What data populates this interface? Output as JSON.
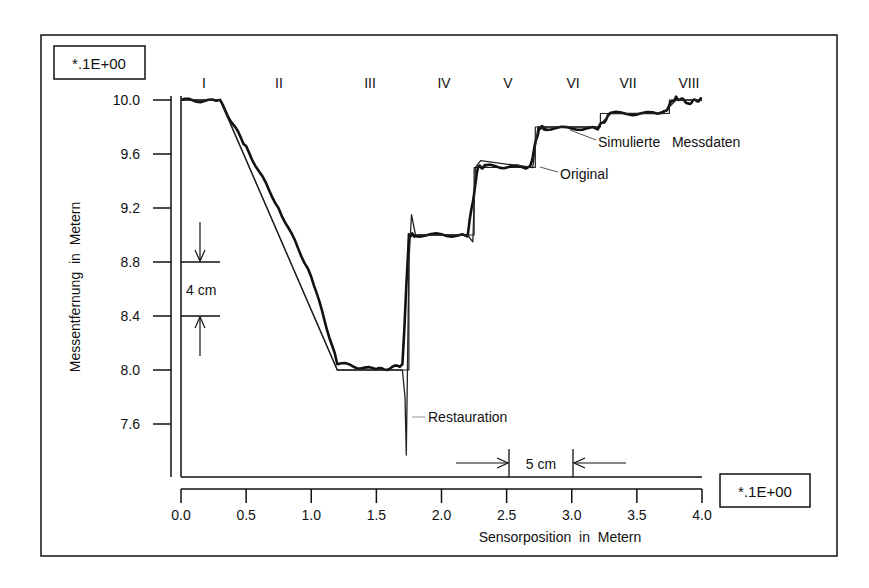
{
  "chart_data": {
    "type": "line",
    "title": "",
    "xlabel": "Sensorposition  in  Metern",
    "ylabel": "Messentfernung  in  Metern",
    "x_scale_label": "*.1E+00",
    "y_scale_label": "*.1E+00",
    "xlim": [
      0.0,
      4.0
    ],
    "ylim": [
      7.2,
      10.2
    ],
    "x_ticks": [
      "0.0",
      "0.5",
      "1.0",
      "1.5",
      "2.0",
      "2.5",
      "3.0",
      "3.5",
      "4.0"
    ],
    "y_ticks": [
      "10.0",
      "9.6",
      "9.2",
      "8.8",
      "8.4",
      "8.0",
      "7.6"
    ],
    "grid": false,
    "segments": [
      "I",
      "II",
      "III",
      "IV",
      "V",
      "VI",
      "VII",
      "VIII"
    ],
    "annotations": [
      {
        "text": "Simulierte   Messdaten",
        "points_to": "noisy measured curve"
      },
      {
        "text": "Original",
        "points_to": "ideal step profile"
      },
      {
        "text": "Restauration",
        "points_to": "restored curve (overshoot at x≈1.75)"
      },
      {
        "text": "4 cm",
        "type": "vertical dimension",
        "between_y": [
          8.4,
          8.8
        ]
      },
      {
        "text": "5 cm",
        "type": "horizontal dimension",
        "between_x": [
          2.5,
          3.0
        ]
      }
    ],
    "series": [
      {
        "name": "Original",
        "x": [
          0.0,
          0.3,
          1.2,
          1.75,
          1.75,
          2.25,
          2.25,
          2.72,
          2.72,
          3.22,
          3.22,
          3.75,
          3.75,
          4.0
        ],
        "y": [
          10.0,
          10.0,
          8.0,
          8.0,
          9.0,
          9.0,
          9.5,
          9.5,
          9.8,
          9.8,
          9.9,
          9.9,
          10.0,
          10.0
        ]
      },
      {
        "name": "Simulierte Messdaten",
        "x": [
          0.0,
          0.3,
          0.5,
          0.75,
          1.0,
          1.2,
          1.5,
          1.7,
          1.75,
          1.8,
          2.2,
          2.28,
          2.35,
          2.68,
          2.75,
          2.8,
          3.2,
          3.3,
          3.7,
          3.8,
          3.9,
          4.0
        ],
        "y": [
          10.0,
          9.99,
          9.65,
          9.2,
          8.7,
          8.05,
          8.0,
          8.03,
          9.0,
          9.0,
          9.0,
          9.5,
          9.51,
          9.5,
          9.8,
          9.79,
          9.79,
          9.9,
          9.9,
          10.02,
          9.98,
          10.01
        ]
      },
      {
        "name": "Restauration",
        "x": [
          0.0,
          0.3,
          1.2,
          1.7,
          1.72,
          1.73,
          1.75,
          1.77,
          1.8,
          2.2,
          2.24,
          2.26,
          2.3,
          2.7,
          2.74,
          2.8,
          3.2,
          3.3,
          3.7,
          3.8,
          4.0
        ],
        "y": [
          10.0,
          10.0,
          8.0,
          8.0,
          7.8,
          7.37,
          8.8,
          9.15,
          9.0,
          9.0,
          8.95,
          9.5,
          9.55,
          9.5,
          9.8,
          9.8,
          9.8,
          9.9,
          9.9,
          10.0,
          10.0
        ]
      }
    ],
    "legend_position": "none (inline annotations)"
  }
}
